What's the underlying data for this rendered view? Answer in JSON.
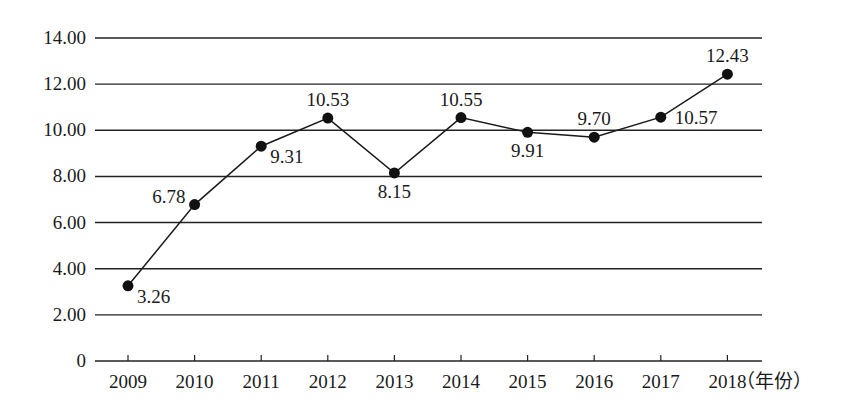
{
  "chart_data": {
    "type": "line",
    "title": "",
    "xlabel": "（年份）",
    "ylabel": "",
    "categories": [
      "2009",
      "2010",
      "2011",
      "2012",
      "2013",
      "2014",
      "2015",
      "2016",
      "2017",
      "2018"
    ],
    "series": [
      {
        "name": "",
        "values": [
          3.26,
          6.78,
          9.31,
          10.53,
          8.15,
          10.55,
          9.91,
          9.7,
          10.57,
          12.43
        ],
        "labels": [
          "3.26",
          "6.78",
          "9.31",
          "10.53",
          "8.15",
          "10.55",
          "9.91",
          "9.70",
          "10.57",
          "12.43"
        ],
        "label_positions": [
          "right-below",
          "left-above",
          "right-below",
          "above",
          "below",
          "above",
          "below",
          "above",
          "right",
          "above"
        ]
      }
    ],
    "yticks": [
      "0",
      "2.00",
      "4.00",
      "6.00",
      "8.00",
      "10.00",
      "12.00",
      "14.00"
    ],
    "ylim": [
      0,
      14
    ],
    "grid": true,
    "legend": "none",
    "colors": {
      "line": "#1a1a1a",
      "marker": "#111111",
      "grid": "#222222"
    }
  }
}
